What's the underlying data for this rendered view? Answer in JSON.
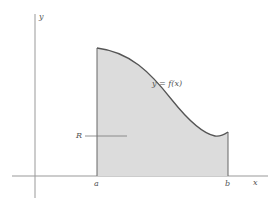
{
  "diagram": {
    "axes": {
      "x_label": "x",
      "y_label": "y"
    },
    "bounds": {
      "a_label": "a",
      "b_label": "b"
    },
    "curve_label": "y = f(x)",
    "region_label": "R",
    "colors": {
      "fill": "#d9d9d9",
      "curve": "#555555",
      "axis": "#888888"
    }
  }
}
